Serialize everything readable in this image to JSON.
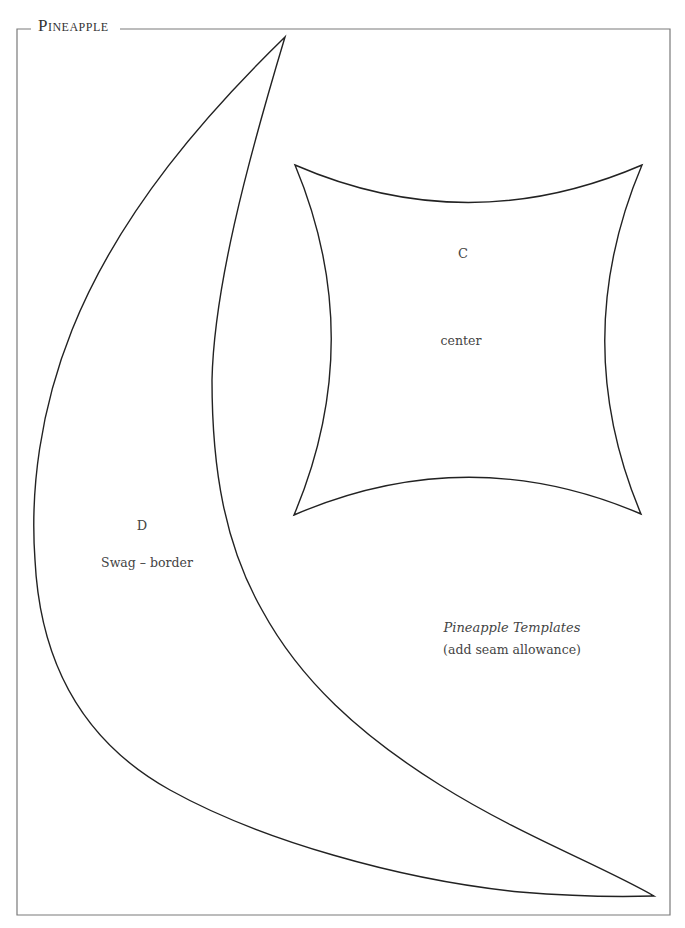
{
  "page": {
    "title": "Pineapple",
    "colors": {
      "frame": "#7a7a7a",
      "outline": "#222222",
      "text": "#444444",
      "background": "#ffffff"
    }
  },
  "templates": [
    {
      "id": "C",
      "letter": "C",
      "name": "center",
      "shape": "concave square"
    },
    {
      "id": "D",
      "letter": "D",
      "name": "Swag – border",
      "shape": "crescent swag"
    }
  ],
  "caption": {
    "title": "Pineapple Templates",
    "note": "(add seam allowance)"
  }
}
